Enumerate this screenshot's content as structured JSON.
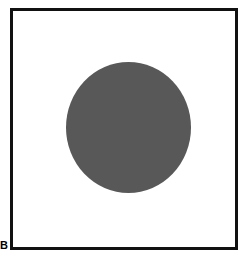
{
  "figure": {
    "panel_label": "B",
    "caption": "",
    "background_color": "#ffffff",
    "width": 247,
    "height": 258
  },
  "frame": {
    "border_color": "#111111",
    "border_width_px": 3,
    "fill_color": "#ffffff",
    "left": 10,
    "top": 8,
    "width": 228,
    "height": 242
  },
  "shapes": [
    {
      "name": "circle",
      "type": "circle",
      "fill_color": "#585858",
      "stroke": "none",
      "center_x": 128,
      "center_y": 127,
      "diameter_px": 127,
      "width_px": 125,
      "height_px": 131
    }
  ]
}
